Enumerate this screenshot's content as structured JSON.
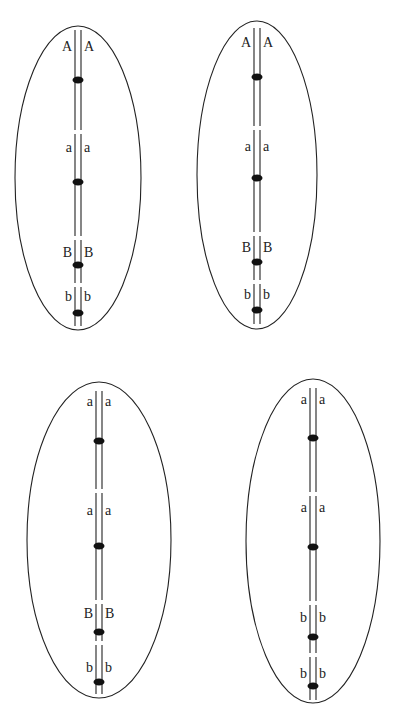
{
  "diagram": {
    "colors": {
      "line": "#222222",
      "centromere": "#111111",
      "background": "#ffffff"
    },
    "cells": [
      {
        "id": "cell-1",
        "ellipse": {
          "cx": 78,
          "cy": 178,
          "rx": 63,
          "ry": 152
        },
        "strand_x": [
          75,
          81
        ],
        "strand_top": 30,
        "strand_bottom": 326,
        "loci": [
          {
            "label_left": "A",
            "label_right": "A",
            "label_y": 48,
            "dot_y": 80,
            "gap_y": 132
          },
          {
            "label_left": "a",
            "label_right": "a",
            "label_y": 149,
            "dot_y": 182,
            "gap_y": 238
          },
          {
            "label_left": "B",
            "label_right": "B",
            "label_y": 254,
            "dot_y": 265,
            "gap_y": 285
          },
          {
            "label_left": "b",
            "label_right": "b",
            "label_y": 298,
            "dot_y": 313,
            "gap_y": null
          }
        ]
      },
      {
        "id": "cell-2",
        "ellipse": {
          "cx": 257,
          "cy": 175,
          "rx": 60,
          "ry": 154
        },
        "strand_x": [
          254,
          260
        ],
        "strand_top": 28,
        "strand_bottom": 324,
        "loci": [
          {
            "label_left": "A",
            "label_right": "A",
            "label_y": 44,
            "dot_y": 77,
            "gap_y": 128
          },
          {
            "label_left": "a",
            "label_right": "a",
            "label_y": 148,
            "dot_y": 178,
            "gap_y": 234
          },
          {
            "label_left": "B",
            "label_right": "B",
            "label_y": 249,
            "dot_y": 262,
            "gap_y": 282
          },
          {
            "label_left": "b",
            "label_right": "b",
            "label_y": 296,
            "dot_y": 310,
            "gap_y": null
          }
        ]
      },
      {
        "id": "cell-3",
        "ellipse": {
          "cx": 99,
          "cy": 540,
          "rx": 72,
          "ry": 158
        },
        "strand_x": [
          96,
          102
        ],
        "strand_top": 391,
        "strand_bottom": 694,
        "loci": [
          {
            "label_left": "a",
            "label_right": "a",
            "label_y": 403,
            "dot_y": 441,
            "gap_y": 491
          },
          {
            "label_left": "a",
            "label_right": "a",
            "label_y": 512,
            "dot_y": 546,
            "gap_y": 602
          },
          {
            "label_left": "B",
            "label_right": "B",
            "label_y": 615,
            "dot_y": 632,
            "gap_y": 643
          },
          {
            "label_left": "b",
            "label_right": "b",
            "label_y": 669,
            "dot_y": 682,
            "gap_y": null
          }
        ]
      },
      {
        "id": "cell-4",
        "ellipse": {
          "cx": 313,
          "cy": 541,
          "rx": 67,
          "ry": 162
        },
        "strand_x": [
          310,
          316
        ],
        "strand_top": 388,
        "strand_bottom": 700,
        "loci": [
          {
            "label_left": "a",
            "label_right": "a",
            "label_y": 401,
            "dot_y": 438,
            "gap_y": 494
          },
          {
            "label_left": "a",
            "label_right": "a",
            "label_y": 509,
            "dot_y": 547,
            "gap_y": 603
          },
          {
            "label_left": "b",
            "label_right": "b",
            "label_y": 619,
            "dot_y": 637,
            "gap_y": 655
          },
          {
            "label_left": "b",
            "label_right": "b",
            "label_y": 675,
            "dot_y": 686,
            "gap_y": null
          }
        ]
      }
    ]
  }
}
